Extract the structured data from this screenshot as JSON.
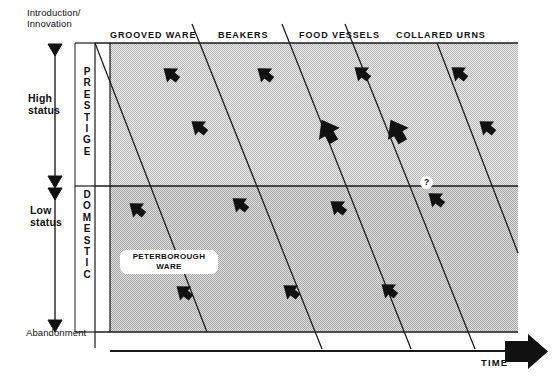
{
  "figure": {
    "background_color": "#ffffff",
    "line_color": "#1a1a1a",
    "shade_color": "#d2d2d2"
  },
  "y_axis": {
    "top_label": "Introduction/\nInnovation",
    "bottom_label": "Abandonment",
    "segments": [
      {
        "name": "high-status",
        "label": "High\nstatus"
      },
      {
        "name": "low-status",
        "label": "Low\nstatus"
      }
    ]
  },
  "bands": [
    {
      "name": "prestige",
      "letters": [
        "P",
        "R",
        "E",
        "S",
        "T",
        "I",
        "G",
        "E"
      ]
    },
    {
      "name": "domestic",
      "letters": [
        "D",
        "O",
        "M",
        "E",
        "S",
        "T",
        "I",
        "C"
      ]
    }
  ],
  "x_axis": {
    "label": "TIME",
    "arrow": "right-arrow"
  },
  "categories": [
    {
      "label": "GROOVED WARE",
      "x": 110
    },
    {
      "label": "BEAKERS",
      "x": 218
    },
    {
      "label": "FOOD VESSELS",
      "x": 299
    },
    {
      "label": "COLLARED URNS",
      "x": 396
    }
  ],
  "annotations": [
    {
      "name": "peterborough-ware-label",
      "text": "PETERBOROUGH\nWARE"
    },
    {
      "name": "uncertainty-marker",
      "text": "?"
    }
  ],
  "chart_data": {
    "type": "diagram",
    "xlabel": "TIME",
    "ylabel": "Introduction/Innovation to Abandonment",
    "grid": false,
    "plot_area": {
      "x": 95,
      "y": 43,
      "w": 423,
      "h": 289
    },
    "divider_y": 186,
    "shaded_region": {
      "x": 110,
      "y": 43,
      "w": 408,
      "h": 289
    },
    "diagonal_lines": [
      {
        "x1": 95,
        "y1": 43,
        "x2": 207,
        "y2": 332
      },
      {
        "x1": 192,
        "y1": 18,
        "x2": 322,
        "y2": 349
      },
      {
        "x1": 282,
        "y1": 18,
        "x2": 411,
        "y2": 349
      },
      {
        "x1": 345,
        "y1": 18,
        "x2": 475,
        "y2": 349
      },
      {
        "x1": 437,
        "y1": 43,
        "x2": 518,
        "y2": 253
      }
    ],
    "markers": [
      {
        "name": "arrow",
        "x": 171,
        "y": 74,
        "size": 17,
        "rot": 128
      },
      {
        "name": "arrow",
        "x": 265,
        "y": 74,
        "size": 17,
        "rot": 128
      },
      {
        "name": "arrow",
        "x": 362,
        "y": 73,
        "size": 17,
        "rot": 128
      },
      {
        "name": "arrow",
        "x": 459,
        "y": 73,
        "size": 17,
        "rot": 128
      },
      {
        "name": "arrow",
        "x": 199,
        "y": 127,
        "size": 17,
        "rot": 128
      },
      {
        "name": "arrow",
        "x": 328,
        "y": 131,
        "size": 23,
        "rot": 150
      },
      {
        "name": "arrow",
        "x": 397,
        "y": 131,
        "size": 23,
        "rot": 150
      },
      {
        "name": "arrow",
        "x": 487,
        "y": 127,
        "size": 17,
        "rot": 128
      },
      {
        "name": "arrow",
        "x": 137,
        "y": 209,
        "size": 17,
        "rot": 128
      },
      {
        "name": "arrow",
        "x": 240,
        "y": 204,
        "size": 17,
        "rot": 128
      },
      {
        "name": "arrow",
        "x": 338,
        "y": 207,
        "size": 17,
        "rot": 128
      },
      {
        "name": "arrow",
        "x": 436,
        "y": 199,
        "size": 17,
        "rot": 128
      },
      {
        "name": "arrow",
        "x": 184,
        "y": 292,
        "size": 17,
        "rot": 128
      },
      {
        "name": "arrow",
        "x": 291,
        "y": 291,
        "size": 17,
        "rot": 128
      },
      {
        "name": "arrow",
        "x": 389,
        "y": 290,
        "size": 17,
        "rot": 128
      }
    ]
  }
}
